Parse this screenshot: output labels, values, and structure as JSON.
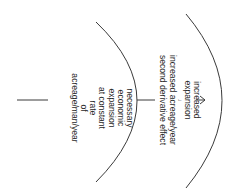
{
  "diagram": {
    "orientation": "rotated-90-clockwise",
    "outer_label": {
      "lines": [
        "increased",
        "expansion",
        "↓",
        "increased acreage/year",
        "second derivative effect"
      ]
    },
    "inner_label": {
      "lines": [
        "necessary",
        "economic",
        "expansion",
        "at constant",
        "rate",
        "of",
        "acreage/man/year"
      ]
    },
    "colors": {
      "line": "#3a3a3a",
      "text": "#2a2a2a",
      "background": "#ffffff"
    }
  }
}
